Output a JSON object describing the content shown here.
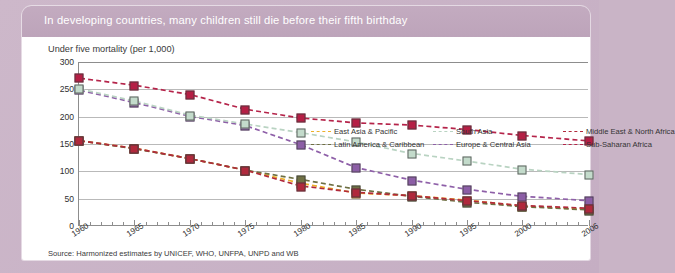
{
  "card": {
    "title": "In developing countries, many children still die before their fifth birthday",
    "source": "Source: Harmonized estimates by UNICEF, WHO, UNFPA, UNPD and WB"
  },
  "chart_data": {
    "type": "line",
    "title": "In developing countries, many children still die before their fifth birthday",
    "subtitle": "Under five mortality (per 1,000)",
    "xlabel": "",
    "ylabel": "Under five mortality (per 1,000)",
    "ylim": [
      0,
      300
    ],
    "yticks": [
      0,
      50,
      100,
      150,
      200,
      250,
      300
    ],
    "grid": true,
    "legend_position": "top-right-inside",
    "x": [
      1960,
      1965,
      1970,
      1975,
      1980,
      1985,
      1990,
      1995,
      2000,
      2006
    ],
    "xtick_labels": [
      "1960",
      "1965",
      "1970",
      "1975",
      "1980",
      "1985",
      "1990",
      "1995",
      "2000",
      "2006"
    ],
    "series": [
      {
        "name": "East Asia & Pacific",
        "color": "#edb12a",
        "marker_fill": "#f3c04b",
        "values": [
          155,
          141,
          122,
          101,
          77,
          59,
          54,
          46,
          35,
          29
        ]
      },
      {
        "name": "Europe & Central Asia",
        "color": "#8e5fa8",
        "marker_fill": "#8c5ea6",
        "values": [
          248,
          225,
          200,
          183,
          148,
          106,
          83,
          66,
          53,
          45
        ]
      },
      {
        "name": "Latin America & Caribbean",
        "color": "#6e6f42",
        "marker_fill": "#6f7044",
        "values": [
          155,
          140,
          122,
          101,
          84,
          66,
          53,
          42,
          34,
          28
        ]
      },
      {
        "name": "Middle East & North Africa",
        "color": "#b12a3c",
        "marker_fill": "#b0293c",
        "values": [
          155,
          141,
          122,
          101,
          72,
          60,
          54,
          45,
          36,
          31
        ]
      },
      {
        "name": "South Asia",
        "color": "#b9d3c2",
        "marker_fill": "#c3dbcb",
        "values": [
          250,
          228,
          202,
          186,
          170,
          153,
          132,
          118,
          103,
          93
        ]
      },
      {
        "name": "Sub-Saharan Africa",
        "color": "#b5244a",
        "marker_fill": "#b51f45",
        "values": [
          270,
          257,
          240,
          213,
          197,
          188,
          184,
          176,
          165,
          155
        ]
      }
    ]
  },
  "legend": [
    {
      "label": "East Asia & Pacific",
      "color": "#edb12a"
    },
    {
      "label": "Latin America & Caribbean",
      "color": "#6e6f42"
    },
    {
      "label": "South Asia",
      "color": "#b9d3c2"
    },
    {
      "label": "Europe & Central Asia",
      "color": "#8e5fa8"
    },
    {
      "label": "Middle East & North Africa",
      "color": "#b12a3c"
    },
    {
      "label": "Sub-Saharan Africa",
      "color": "#b5244a"
    }
  ],
  "legend_order": [
    0,
    2,
    4,
    1,
    3,
    5
  ]
}
